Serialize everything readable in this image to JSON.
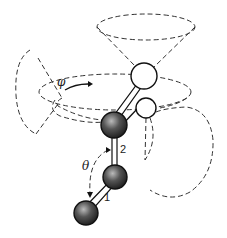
{
  "diagram": {
    "type": "molecular rotation cones",
    "labels": {
      "phi": "φ",
      "theta": "θ",
      "bond_1": "1",
      "bond_2": "2"
    },
    "colors": {
      "line": "#111111",
      "dashed": "#333333",
      "background": "#ffffff"
    }
  }
}
